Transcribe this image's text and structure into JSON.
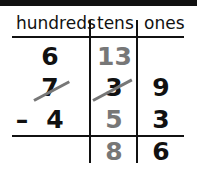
{
  "headers": {
    "hundreds": "hundreds",
    "tens": "tens",
    "ones": "ones"
  },
  "rows": {
    "regroup": {
      "hundreds": "6",
      "tens": "13",
      "ones": ""
    },
    "minuend": {
      "hundreds": "7",
      "tens": "3",
      "ones": "9",
      "hundreds_crossed": true,
      "tens_crossed": true
    },
    "subtrahend": {
      "sign": "–",
      "hundreds": "4",
      "tens": "5",
      "ones": "3"
    },
    "difference": {
      "hundreds": "",
      "tens": "8",
      "ones": "6"
    }
  },
  "colors": {
    "ink": "#111111",
    "regroup_gray": "#777777"
  }
}
